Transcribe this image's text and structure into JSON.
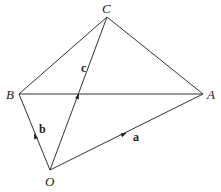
{
  "diagram": {
    "points": {
      "O": {
        "label": "O",
        "x": 50,
        "y": 170
      },
      "A": {
        "label": "A",
        "x": 203,
        "y": 94
      },
      "B": {
        "label": "B",
        "x": 19,
        "y": 94
      },
      "C": {
        "label": "C",
        "x": 107,
        "y": 17
      }
    },
    "segments": [
      "OA",
      "OB",
      "OC",
      "BC",
      "CA",
      "BA"
    ],
    "vectors": [
      {
        "name": "a",
        "label": "a",
        "from": "O",
        "to": "A"
      },
      {
        "name": "b",
        "label": "b",
        "from": "O",
        "to": "B"
      },
      {
        "name": "c",
        "label": "c",
        "from": "O",
        "to": "C"
      }
    ],
    "colors": {
      "line": "#333333",
      "text": "#222222",
      "background": "#ffffff"
    }
  }
}
